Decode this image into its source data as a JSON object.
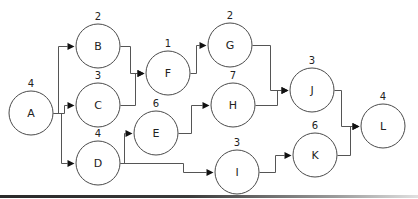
{
  "diagram": {
    "type": "activity-network",
    "nodes": [
      {
        "id": "A",
        "label": "A",
        "duration": "4",
        "cx": 31,
        "cy": 113,
        "r": 22
      },
      {
        "id": "B",
        "label": "B",
        "duration": "2",
        "cx": 98,
        "cy": 46,
        "r": 22
      },
      {
        "id": "C",
        "label": "C",
        "duration": "3",
        "cx": 98,
        "cy": 105,
        "r": 22
      },
      {
        "id": "D",
        "label": "D",
        "duration": "4",
        "cx": 98,
        "cy": 163,
        "r": 22
      },
      {
        "id": "E",
        "label": "E",
        "duration": "6",
        "cx": 156,
        "cy": 133,
        "r": 22
      },
      {
        "id": "F",
        "label": "F",
        "duration": "1",
        "cx": 168,
        "cy": 73,
        "r": 22
      },
      {
        "id": "G",
        "label": "G",
        "duration": "2",
        "cx": 230,
        "cy": 45,
        "r": 22
      },
      {
        "id": "H",
        "label": "H",
        "duration": "7",
        "cx": 233,
        "cy": 105,
        "r": 22
      },
      {
        "id": "I",
        "label": "I",
        "duration": "3",
        "cx": 237,
        "cy": 172,
        "r": 22
      },
      {
        "id": "J",
        "label": "J",
        "duration": "3",
        "cx": 312,
        "cy": 90,
        "r": 22
      },
      {
        "id": "K",
        "label": "K",
        "duration": "6",
        "cx": 315,
        "cy": 155,
        "r": 22
      },
      {
        "id": "L",
        "label": "L",
        "duration": "4",
        "cx": 383,
        "cy": 126,
        "r": 22
      }
    ],
    "edges": [
      {
        "from": "A",
        "to": "B",
        "points": [
          [
            53,
            113
          ],
          [
            58,
            113
          ],
          [
            58,
            46
          ],
          [
            74,
            46
          ]
        ]
      },
      {
        "from": "A",
        "to": "C",
        "points": [
          [
            53,
            113
          ],
          [
            64,
            113
          ],
          [
            64,
            105
          ],
          [
            74,
            105
          ]
        ]
      },
      {
        "from": "A",
        "to": "D",
        "points": [
          [
            58,
            113
          ],
          [
            61,
            113
          ],
          [
            61,
            163
          ],
          [
            74,
            163
          ]
        ]
      },
      {
        "from": "B",
        "to": "F",
        "points": [
          [
            120,
            46
          ],
          [
            130,
            46
          ],
          [
            130,
            73
          ],
          [
            144,
            73
          ]
        ]
      },
      {
        "from": "C",
        "to": "F",
        "points": [
          [
            120,
            105
          ],
          [
            135,
            105
          ],
          [
            135,
            73
          ],
          [
            144,
            73
          ]
        ]
      },
      {
        "from": "D",
        "to": "E",
        "points": [
          [
            120,
            163
          ],
          [
            124,
            163
          ],
          [
            124,
            133
          ],
          [
            132,
            133
          ]
        ]
      },
      {
        "from": "D",
        "to": "I",
        "points": [
          [
            120,
            163
          ],
          [
            183,
            163
          ],
          [
            183,
            172
          ],
          [
            213,
            172
          ]
        ]
      },
      {
        "from": "E",
        "to": "H",
        "points": [
          [
            178,
            133
          ],
          [
            191,
            133
          ],
          [
            191,
            105
          ],
          [
            209,
            105
          ]
        ]
      },
      {
        "from": "F",
        "to": "G",
        "points": [
          [
            190,
            73
          ],
          [
            196,
            73
          ],
          [
            196,
            45
          ],
          [
            206,
            45
          ]
        ]
      },
      {
        "from": "G",
        "to": "J",
        "points": [
          [
            252,
            45
          ],
          [
            270,
            45
          ],
          [
            270,
            90
          ],
          [
            288,
            90
          ]
        ]
      },
      {
        "from": "H",
        "to": "J",
        "points": [
          [
            255,
            105
          ],
          [
            277,
            105
          ],
          [
            277,
            90
          ],
          [
            288,
            90
          ]
        ]
      },
      {
        "from": "I",
        "to": "K",
        "points": [
          [
            259,
            172
          ],
          [
            275,
            172
          ],
          [
            275,
            155
          ],
          [
            291,
            155
          ]
        ]
      },
      {
        "from": "J",
        "to": "L",
        "points": [
          [
            334,
            90
          ],
          [
            341,
            90
          ],
          [
            341,
            126
          ],
          [
            359,
            126
          ]
        ]
      },
      {
        "from": "K",
        "to": "L",
        "points": [
          [
            337,
            155
          ],
          [
            350,
            155
          ],
          [
            350,
            126
          ],
          [
            359,
            126
          ]
        ]
      }
    ]
  },
  "decoration": {
    "bottom_bar": "dark gradient rule along bottom edge"
  }
}
